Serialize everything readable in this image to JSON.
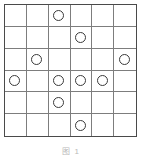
{
  "figure": {
    "caption": "图 1",
    "kind": "grid-puzzle-diagram",
    "colors": {
      "background": "#ffffff",
      "outer_border": "#4a4a4a",
      "inner_line": "#7d7d7d",
      "stone_stroke": "#3a3a3a",
      "caption_text": "#b9b9b9"
    }
  },
  "grid": {
    "rows": 6,
    "columns": 6,
    "cell_marker": "circle",
    "marker_fill": "none",
    "row_labels": [
      "1",
      "2",
      "3",
      "4",
      "5",
      "6"
    ],
    "column_labels": [
      "1",
      "2",
      "3",
      "4",
      "5",
      "6"
    ],
    "total_markers": 10,
    "markers_by_row": [
      1,
      1,
      2,
      4,
      1,
      1
    ],
    "cells": [
      [
        false,
        false,
        true,
        false,
        false,
        false
      ],
      [
        false,
        false,
        false,
        true,
        false,
        false
      ],
      [
        false,
        true,
        false,
        false,
        false,
        true
      ],
      [
        true,
        false,
        true,
        true,
        true,
        false
      ],
      [
        false,
        false,
        true,
        false,
        false,
        false
      ],
      [
        false,
        false,
        false,
        true,
        false,
        false
      ]
    ],
    "marker_positions": [
      {
        "row": 1,
        "col": 3
      },
      {
        "row": 2,
        "col": 4
      },
      {
        "row": 3,
        "col": 2
      },
      {
        "row": 3,
        "col": 6
      },
      {
        "row": 4,
        "col": 1
      },
      {
        "row": 4,
        "col": 3
      },
      {
        "row": 4,
        "col": 4
      },
      {
        "row": 4,
        "col": 5
      },
      {
        "row": 5,
        "col": 3
      },
      {
        "row": 6,
        "col": 4
      }
    ]
  }
}
